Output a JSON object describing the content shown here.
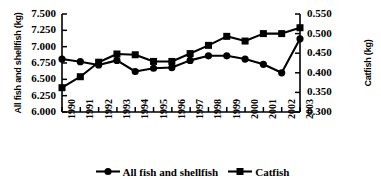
{
  "chart_data": {
    "type": "line",
    "title": "",
    "xlabel": "",
    "categories": [
      "1990",
      "1991",
      "1992",
      "1993",
      "1994",
      "1995",
      "1996",
      "1997",
      "1998",
      "1999",
      "2000",
      "2001",
      "2002",
      "2003"
    ],
    "grid": false,
    "legend_position": "bottom",
    "axes": {
      "left": {
        "label": "All fish and shellfish (kg)",
        "ticks": [
          "6.000",
          "6.250",
          "6.500",
          "6.750",
          "7.000",
          "7.250",
          "7.500"
        ],
        "min": 6.0,
        "max": 7.5,
        "step": 0.25
      },
      "right": {
        "label": "Catfish (kg)",
        "ticks": [
          "0.300",
          "0.350",
          "0.400",
          "0.450",
          "0.500",
          "0.550"
        ],
        "min": 0.3,
        "max": 0.55,
        "step": 0.05
      }
    },
    "series": [
      {
        "name": "All fish and shellfish",
        "axis": "left",
        "marker": "circle",
        "values": [
          6.81,
          6.77,
          6.72,
          6.79,
          6.62,
          6.67,
          6.68,
          6.79,
          6.86,
          6.86,
          6.81,
          6.73,
          6.6,
          7.12
        ]
      },
      {
        "name": "Catfish",
        "axis": "right",
        "marker": "square",
        "values": [
          0.362,
          0.39,
          0.427,
          0.448,
          0.446,
          0.429,
          0.429,
          0.449,
          0.47,
          0.493,
          0.481,
          0.5,
          0.5,
          0.515
        ]
      }
    ]
  },
  "legend": {
    "entries": [
      {
        "label": "All fish and shellfish",
        "marker": "circle"
      },
      {
        "label": "Catfish",
        "marker": "square"
      }
    ]
  }
}
